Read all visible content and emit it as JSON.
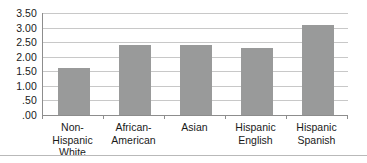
{
  "chart_data": {
    "type": "bar",
    "title": "",
    "subtitle": "",
    "xlabel": "",
    "ylabel": "",
    "categories": [
      "Non-Hispanic\nWhite",
      "African-\nAmerican",
      "Asian",
      "Hispanic\nEnglish",
      "Hispanic\nSpanish"
    ],
    "values": [
      1.6,
      2.4,
      2.4,
      2.3,
      3.1
    ],
    "ylim": [
      0.0,
      3.5
    ],
    "ytick_values": [
      3.5,
      3.0,
      2.5,
      2.0,
      1.5,
      1.0,
      0.5,
      0.0
    ],
    "ytick_labels": [
      "3.50",
      "3.00",
      "2.50",
      "2.00",
      "1.50",
      "1.00",
      ".50",
      ".00"
    ],
    "grid": true,
    "legend": false,
    "legend_position": "none",
    "bar_color": "#999a9a",
    "gridline_color": "#c8c8c8",
    "axis_color": "#8d8d8d",
    "background_color": "#ffffff"
  }
}
